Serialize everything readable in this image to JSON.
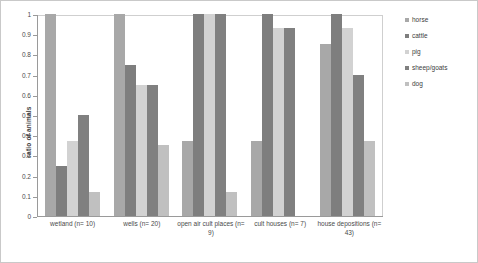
{
  "chart_data": {
    "type": "bar",
    "title": "",
    "subtitle": "",
    "xlabel": "",
    "ylabel": "ratio of animals",
    "ylim": [
      0,
      1
    ],
    "yticks": [
      "0",
      "0.1",
      "0.2",
      "0.3",
      "0.4",
      "0.5",
      "0.6",
      "0.7",
      "0.8",
      "0.9",
      "1"
    ],
    "ytick_values": [
      0,
      0.1,
      0.2,
      0.3,
      0.4,
      0.5,
      0.6,
      0.7,
      0.8,
      0.9,
      1
    ],
    "grid": false,
    "legend_position": "right",
    "categories": [
      "wetland (n= 10)",
      "wells (n= 20)",
      "open air cult places (n= 9)",
      "cult houses (n= 7)",
      "house depositions (n= 43)"
    ],
    "series": [
      {
        "name": "horse",
        "color": "#a8a8a8",
        "values": [
          1.0,
          1.0,
          0.37,
          0.37,
          0.85
        ]
      },
      {
        "name": "cattle",
        "color": "#7e7e7e",
        "values": [
          0.25,
          0.75,
          1.0,
          1.0,
          1.0
        ]
      },
      {
        "name": "pig",
        "color": "#d2d2d2",
        "values": [
          0.37,
          0.65,
          1.0,
          0.93,
          0.93
        ]
      },
      {
        "name": "sheep/goats",
        "color": "#808080",
        "values": [
          0.5,
          0.65,
          1.0,
          0.93,
          0.7
        ]
      },
      {
        "name": "dog",
        "color": "#c0c0c0",
        "values": [
          0.12,
          0.35,
          0.12,
          0.0,
          0.37
        ]
      }
    ]
  },
  "legend": {
    "items": [
      {
        "label": "horse"
      },
      {
        "label": "cattle"
      },
      {
        "label": "pig"
      },
      {
        "label": "sheep/goats"
      },
      {
        "label": "dog"
      }
    ]
  }
}
